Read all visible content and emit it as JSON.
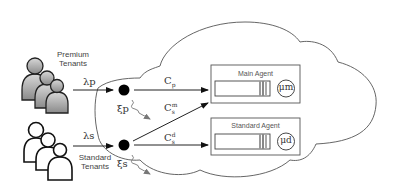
{
  "diagram": {
    "type": "cloud-queueing-model",
    "cloud": {
      "outline_color": "#555555"
    },
    "tenant_groups": [
      {
        "id": "premium",
        "label_line1": "Premium",
        "label_line2": "Tenants",
        "style": "gray-filled",
        "arrival_rate": "λp"
      },
      {
        "id": "standard",
        "label_line1": "Standard",
        "label_line2": "Tenants",
        "style": "white-outline",
        "arrival_rate": "λs"
      }
    ],
    "dispatchers": [
      {
        "id": "premium-dispatcher",
        "drop_rate": "ξp"
      },
      {
        "id": "standard-dispatcher",
        "drop_rate": "ξs"
      }
    ],
    "flows": [
      {
        "from": "premium-dispatcher",
        "to": "main-agent",
        "label": "C",
        "sub": "p",
        "sup": ""
      },
      {
        "from": "standard-dispatcher",
        "to": "main-agent",
        "label": "C",
        "sub": "s",
        "sup": "m"
      },
      {
        "from": "standard-dispatcher",
        "to": "standard-agent",
        "label": "C",
        "sub": "s",
        "sup": "d"
      }
    ],
    "agents": [
      {
        "id": "main-agent",
        "title": "Main Agent",
        "service_rate": "μm"
      },
      {
        "id": "standard-agent",
        "title": "Standard Agent",
        "service_rate": "μd"
      }
    ]
  }
}
